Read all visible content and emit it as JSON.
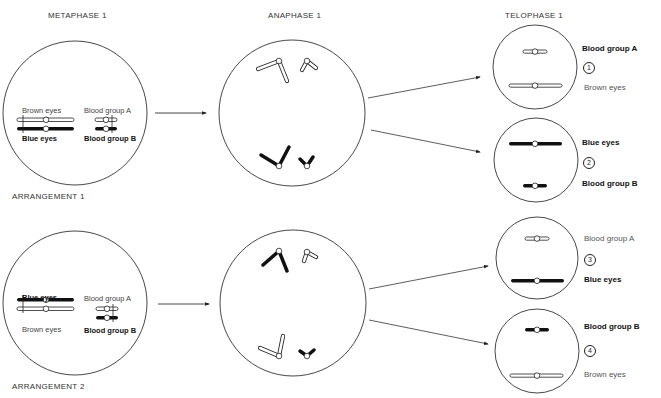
{
  "headings": {
    "metaphase": "METAPHASE 1",
    "anaphase": "ANAPHASE 1",
    "telophase": "TELOPHASE 1"
  },
  "arrangements": [
    {
      "label": "ARRANGEMENT 1",
      "metaphase": {
        "top_left": "Brown eyes",
        "top_right": "Blood group A",
        "bottom_left": "Blue eyes",
        "bottom_right": "Blood group B"
      },
      "telophase": [
        {
          "number": "1",
          "top_label": "Blood group A",
          "bottom_label": "Brown eyes"
        },
        {
          "number": "2",
          "top_label": "Blue eyes",
          "bottom_label": "Blood group B"
        }
      ]
    },
    {
      "label": "ARRANGEMENT 2",
      "metaphase": {
        "top_left": "Blue eyes",
        "top_right": "Blood group A",
        "bottom_left": "Brown eyes",
        "bottom_right": "Blood group B"
      },
      "telophase": [
        {
          "number": "3",
          "top_label": "Blood group A",
          "bottom_label": "Blue eyes"
        },
        {
          "number": "4",
          "top_label": "Blood group B",
          "bottom_label": "Brown eyes"
        }
      ]
    }
  ],
  "colors": {
    "line": "#333333",
    "dark_chromosome": "#111111",
    "light_chromosome": "#ffffff"
  }
}
